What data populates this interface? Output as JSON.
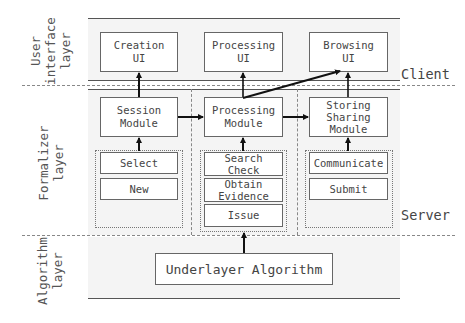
{
  "layers": {
    "ui": {
      "label": "User\ninterface\nlayer"
    },
    "formalizer": {
      "label": "Formalizer\nlayer"
    },
    "algorithm": {
      "label": "Algorithm\nlayer"
    }
  },
  "side_labels": {
    "client": "Client",
    "server": "Server"
  },
  "ui_row": [
    {
      "id": "creation-ui",
      "label": "Creation\nUI"
    },
    {
      "id": "processing-ui",
      "label": "Processing\nUI"
    },
    {
      "id": "browsing-ui",
      "label": "Browsing\nUI"
    }
  ],
  "module_row": [
    {
      "id": "session-module",
      "label": "Session\nModule"
    },
    {
      "id": "processing-module",
      "label": "Processing\nModule"
    },
    {
      "id": "storing-sharing-module",
      "label": "Storing\nSharing\nModule"
    }
  ],
  "sub_items": {
    "session": [
      "Select",
      "New"
    ],
    "processing": [
      "Search\nCheck",
      "Obtain\nEvidence",
      "Issue"
    ],
    "storing": [
      "Communicate",
      "Submit"
    ]
  },
  "algorithm_box": {
    "label": "Underlayer Algorithm"
  },
  "connections": [
    {
      "from": "session-module",
      "to": "creation-ui",
      "type": "arrow"
    },
    {
      "from": "session-module",
      "to": "processing-module",
      "type": "arrow"
    },
    {
      "from": "processing-module",
      "to": "processing-ui",
      "type": "arrow"
    },
    {
      "from": "processing-module",
      "to": "browsing-ui",
      "type": "arrow"
    },
    {
      "from": "processing-module",
      "to": "storing-sharing-module",
      "type": "arrow"
    },
    {
      "from": "storing-sharing-module",
      "to": "browsing-ui",
      "type": "arrow"
    },
    {
      "from": "session-sub-items",
      "to": "session-module",
      "type": "arrow"
    },
    {
      "from": "processing-sub-items",
      "to": "processing-module",
      "type": "arrow"
    },
    {
      "from": "storing-sub-items",
      "to": "storing-sharing-module",
      "type": "arrow"
    },
    {
      "from": "underlayer-algorithm",
      "to": "processing-sub-items",
      "type": "arrow"
    }
  ]
}
